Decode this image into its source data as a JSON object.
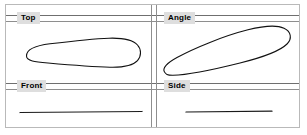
{
  "window": {
    "title": "Four-View Orthographic Layout",
    "background_color": "#ffffff",
    "border_color": "#b9b9b9"
  },
  "theme": {
    "rule_color": "#8e8e8e",
    "label_background": "#dedede",
    "label_text_color": "#000000",
    "outline_color": "#111111"
  },
  "viewports": [
    {
      "id": "top",
      "label": "Top",
      "position": "top-left",
      "content": "wing-planform-outline",
      "description": "Teardrop wing planform, blunt rounded left end tapering to a rounded tip at right"
    },
    {
      "id": "angle",
      "label": "Angle",
      "position": "top-right",
      "content": "wing-planform-outline-rotated",
      "description": "Same wing planform rotated diagonally, narrow tip at lower-left rising to blunt rounded end at upper-right"
    },
    {
      "id": "front",
      "label": "Front",
      "position": "bottom-left",
      "content": "edge-on-line",
      "description": "Edge-on view of the wing rendered as a thin horizontal line"
    },
    {
      "id": "side",
      "label": "Side",
      "position": "bottom-right",
      "content": "edge-on-line",
      "description": "Edge-on view of the wing rendered as a thin horizontal line"
    }
  ],
  "dividers": {
    "horizontal_count": 2,
    "vertical_count": 1,
    "style": "double-line"
  }
}
